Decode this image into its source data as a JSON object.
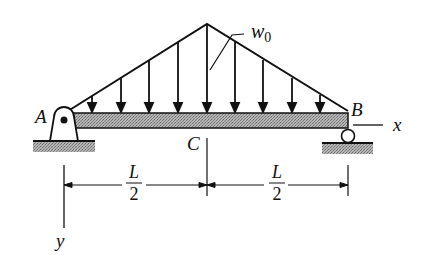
{
  "diagram": {
    "type": "simply-supported beam with triangular distributed load",
    "labels": {
      "support_left": "A",
      "support_right": "B",
      "midpoint": "C",
      "load": "w",
      "load_subscript": "0",
      "x_axis": "x",
      "y_axis": "y",
      "dim_left_num": "L",
      "dim_left_den": "2",
      "dim_right_num": "L",
      "dim_right_den": "2"
    },
    "colors": {
      "line": "#111111",
      "beam_fill": "#9a9a9a",
      "ground_fill": "#a8a8a8"
    }
  }
}
